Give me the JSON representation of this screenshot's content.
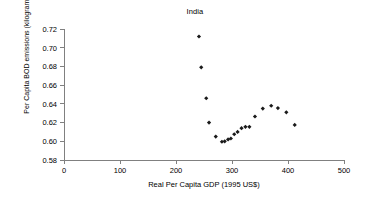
{
  "chart_data": {
    "type": "scatter",
    "title": "India",
    "xlabel": "Real Per Capita GDP (1995 US$)",
    "ylabel": "Per Capita BOD emissions (kilogram)",
    "xlim": [
      0,
      500
    ],
    "ylim": [
      0.58,
      0.72
    ],
    "xticks": [
      0,
      100,
      200,
      300,
      400,
      500
    ],
    "yticks": [
      0.58,
      0.6,
      0.62,
      0.64,
      0.66,
      0.68,
      0.7,
      0.72
    ],
    "xtick_labels": [
      "0",
      "100",
      "200",
      "300",
      "400",
      "500"
    ],
    "ytick_labels": [
      "0.58",
      "0.60",
      "0.62",
      "0.64",
      "0.66",
      "0.68",
      "0.70",
      "0.72"
    ],
    "grid": false,
    "legend": false,
    "marker": "diamond",
    "marker_color": "#1a1a1a",
    "series": [
      {
        "name": "India",
        "points": [
          {
            "x": 241,
            "y": 0.712
          },
          {
            "x": 245,
            "y": 0.679
          },
          {
            "x": 254,
            "y": 0.646
          },
          {
            "x": 259,
            "y": 0.62
          },
          {
            "x": 271,
            "y": 0.605
          },
          {
            "x": 282,
            "y": 0.5995
          },
          {
            "x": 287,
            "y": 0.6
          },
          {
            "x": 293,
            "y": 0.602
          },
          {
            "x": 298,
            "y": 0.603
          },
          {
            "x": 304,
            "y": 0.6075
          },
          {
            "x": 310,
            "y": 0.61
          },
          {
            "x": 317,
            "y": 0.614
          },
          {
            "x": 324,
            "y": 0.6155
          },
          {
            "x": 331,
            "y": 0.6155
          },
          {
            "x": 341,
            "y": 0.6265
          },
          {
            "x": 355,
            "y": 0.635
          },
          {
            "x": 370,
            "y": 0.638
          },
          {
            "x": 382,
            "y": 0.6355
          },
          {
            "x": 397,
            "y": 0.631
          },
          {
            "x": 412,
            "y": 0.6175
          }
        ]
      }
    ]
  }
}
